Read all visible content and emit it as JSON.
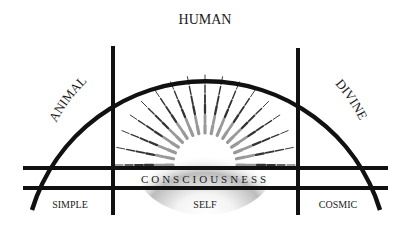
{
  "diagram": {
    "arc_labels": {
      "left": "ANIMAL",
      "top": "HUMAN",
      "right": "DIVINE"
    },
    "band_label": "CONSCIOUSNESS",
    "columns": [
      "SIMPLE",
      "SELF",
      "COSMIC"
    ],
    "colors": {
      "line": "#111111",
      "background": "#ffffff"
    }
  }
}
